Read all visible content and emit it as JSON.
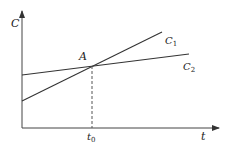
{
  "diagram": {
    "type": "line-intersection",
    "axes": {
      "y_label": "C",
      "x_label": "t"
    },
    "lines": [
      {
        "name": "C",
        "subscript": "1",
        "description": "steeper rising line"
      },
      {
        "name": "C",
        "subscript": "2",
        "description": "gently rising line"
      }
    ],
    "intersection": {
      "label": "A",
      "x_tick_label": "t",
      "x_tick_subscript": "0"
    },
    "colors": {
      "line": "#333333",
      "background": "#ffffff"
    }
  }
}
